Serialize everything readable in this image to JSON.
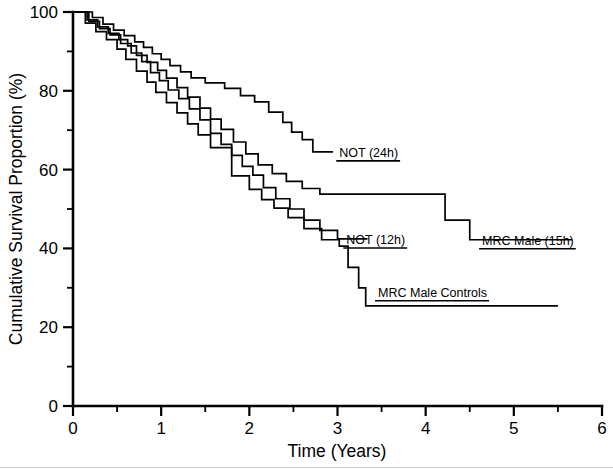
{
  "figure": {
    "background_color": "#ffffff",
    "ink_color": "#000000"
  },
  "chart_data": {
    "type": "line",
    "subtype": "kaplan-meier-step",
    "title": "",
    "subtitle": "",
    "xlabel": "Time (Years)",
    "ylabel": "Cumulative Survival Proportion (%)",
    "xlim": [
      0,
      6
    ],
    "ylim": [
      0,
      100
    ],
    "x_ticks": [
      0,
      1,
      2,
      3,
      4,
      5,
      6
    ],
    "x_tick_labels": [
      "0",
      "1",
      "2",
      "3",
      "4",
      "5",
      "6"
    ],
    "x_minor_ticks": [
      0.5,
      1.5,
      2.5,
      3.5,
      4.5,
      5.5
    ],
    "y_ticks": [
      0,
      20,
      40,
      60,
      80,
      100
    ],
    "y_tick_labels": [
      "0",
      "20",
      "40",
      "60",
      "80",
      "100"
    ],
    "y_minor_ticks": [
      10,
      30,
      50,
      70,
      90
    ],
    "grid": false,
    "legend_position": "inline-annotations",
    "series": [
      {
        "name": "NOT (24h)",
        "label": "NOT (24h)",
        "color": "#000000",
        "x": [
          0.0,
          0.22,
          0.22,
          0.34,
          0.34,
          0.46,
          0.46,
          0.58,
          0.58,
          0.7,
          0.7,
          0.8,
          0.8,
          0.9,
          0.9,
          1.0,
          1.0,
          1.1,
          1.1,
          1.22,
          1.22,
          1.34,
          1.34,
          1.5,
          1.5,
          1.72,
          1.72,
          1.9,
          1.9,
          2.06,
          2.06,
          2.22,
          2.22,
          2.38,
          2.38,
          2.48,
          2.48,
          2.6,
          2.6,
          2.72,
          2.72,
          2.95
        ],
        "y": [
          100.0,
          100.0,
          98.6,
          98.6,
          96.9,
          96.9,
          95.4,
          95.4,
          94.0,
          94.0,
          92.4,
          92.4,
          91.0,
          91.0,
          89.4,
          89.4,
          88.0,
          88.0,
          86.4,
          86.4,
          84.8,
          84.8,
          83.3,
          83.3,
          82.0,
          82.0,
          80.6,
          80.6,
          78.8,
          78.8,
          77.2,
          77.2,
          74.6,
          74.6,
          72.0,
          72.0,
          69.5,
          69.5,
          67.6,
          67.6,
          64.5,
          64.5
        ],
        "label_anchor_x": 3.0,
        "label_anchor_y": 64.5,
        "final_value": 64.5
      },
      {
        "name": "MRC Male (15h)",
        "label": "MRC Male (15h)",
        "color": "#000000",
        "x": [
          0.0,
          0.16,
          0.16,
          0.28,
          0.28,
          0.4,
          0.4,
          0.52,
          0.52,
          0.62,
          0.62,
          0.72,
          0.72,
          0.84,
          0.84,
          0.96,
          0.96,
          1.06,
          1.06,
          1.18,
          1.18,
          1.3,
          1.3,
          1.44,
          1.44,
          1.56,
          1.56,
          1.68,
          1.68,
          1.82,
          1.82,
          1.96,
          1.96,
          2.1,
          2.1,
          2.26,
          2.26,
          2.42,
          2.42,
          2.6,
          2.6,
          2.8,
          2.8,
          4.22,
          4.22,
          4.5,
          4.5,
          5.66
        ],
        "y": [
          100.0,
          100.0,
          98.0,
          98.0,
          96.2,
          96.2,
          94.6,
          94.6,
          93.0,
          93.0,
          91.4,
          91.4,
          89.0,
          89.0,
          87.2,
          87.2,
          85.2,
          85.2,
          83.2,
          83.2,
          80.8,
          80.8,
          78.4,
          78.4,
          75.6,
          75.6,
          72.8,
          72.8,
          70.2,
          70.2,
          67.0,
          67.0,
          64.0,
          64.0,
          61.2,
          61.2,
          59.0,
          59.0,
          57.0,
          57.0,
          55.2,
          55.2,
          53.8,
          53.8,
          47.2,
          47.2,
          42.2,
          42.2
        ],
        "label_anchor_x": 4.62,
        "label_anchor_y": 42.2,
        "final_value": 42.2
      },
      {
        "name": "NOT (12h)",
        "label": "NOT (12h)",
        "color": "#000000",
        "x": [
          0.0,
          0.18,
          0.18,
          0.3,
          0.3,
          0.42,
          0.42,
          0.54,
          0.54,
          0.66,
          0.66,
          0.78,
          0.78,
          0.88,
          0.88,
          0.98,
          0.98,
          1.08,
          1.08,
          1.2,
          1.2,
          1.32,
          1.32,
          1.44,
          1.44,
          1.56,
          1.56,
          1.68,
          1.68,
          1.8,
          1.8,
          1.92,
          1.92,
          2.04,
          2.04,
          2.16,
          2.16,
          2.3,
          2.3,
          2.46,
          2.46,
          2.62,
          2.62,
          2.8,
          2.8,
          3.0,
          3.0,
          3.34
        ],
        "y": [
          100.0,
          100.0,
          97.6,
          97.6,
          95.8,
          95.8,
          94.2,
          94.2,
          92.0,
          92.0,
          89.6,
          89.6,
          87.4,
          87.4,
          84.6,
          84.6,
          82.6,
          82.6,
          80.2,
          80.2,
          78.0,
          78.0,
          75.4,
          75.4,
          72.6,
          72.6,
          69.2,
          69.2,
          66.4,
          66.4,
          63.6,
          63.6,
          60.8,
          60.8,
          58.6,
          58.6,
          55.4,
          55.4,
          52.6,
          52.6,
          50.0,
          50.0,
          47.2,
          47.2,
          44.6,
          44.6,
          42.4,
          42.4
        ],
        "label_anchor_x": 3.08,
        "label_anchor_y": 42.4,
        "final_value": 42.4
      },
      {
        "name": "MRC Male Controls",
        "label": "MRC Male Controls",
        "color": "#000000",
        "x": [
          0.0,
          0.14,
          0.14,
          0.26,
          0.26,
          0.38,
          0.38,
          0.5,
          0.5,
          0.6,
          0.6,
          0.72,
          0.72,
          0.84,
          0.84,
          0.94,
          0.94,
          1.06,
          1.06,
          1.18,
          1.18,
          1.3,
          1.3,
          1.42,
          1.42,
          1.56,
          1.56,
          1.8,
          1.8,
          2.0,
          2.0,
          2.14,
          2.14,
          2.28,
          2.28,
          2.44,
          2.44,
          2.62,
          2.62,
          2.82,
          2.82,
          3.02,
          3.02,
          3.12,
          3.12,
          3.24,
          3.24,
          3.32,
          3.32,
          5.5
        ],
        "y": [
          100.0,
          100.0,
          97.2,
          97.2,
          95.0,
          95.0,
          93.0,
          93.0,
          90.6,
          90.6,
          88.0,
          88.0,
          85.0,
          85.0,
          82.2,
          82.2,
          79.6,
          79.6,
          77.0,
          77.0,
          74.4,
          74.4,
          71.6,
          71.6,
          68.8,
          68.8,
          65.6,
          65.6,
          58.4,
          58.4,
          55.0,
          55.0,
          52.4,
          52.4,
          50.2,
          50.2,
          47.8,
          47.8,
          45.0,
          45.0,
          42.2,
          42.2,
          40.6,
          40.6,
          35.2,
          35.2,
          30.0,
          30.0,
          25.4,
          25.4
        ],
        "label_anchor_x": 3.42,
        "label_anchor_y": 29.0,
        "final_value": 25.4
      }
    ],
    "annotations": [
      {
        "text": "NOT (24h)",
        "x": 3.02,
        "y": 64.5,
        "underline": true
      },
      {
        "text": "NOT (12h)",
        "x": 3.1,
        "y": 42.4,
        "underline": true
      },
      {
        "text": "MRC Male (15h)",
        "x": 4.64,
        "y": 42.2,
        "underline": true
      },
      {
        "text": "MRC Male Controls",
        "x": 3.46,
        "y": 29.0,
        "underline": true
      }
    ]
  }
}
